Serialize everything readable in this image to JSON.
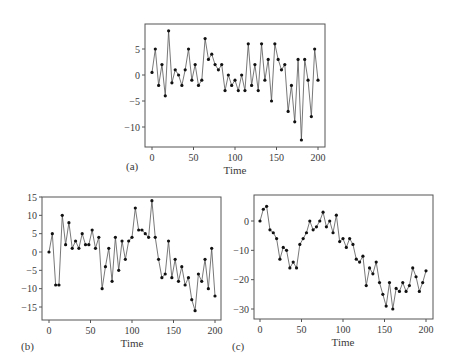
{
  "figure": {
    "panels": [
      "(a)",
      "(b)",
      "(c)"
    ]
  },
  "colors": {
    "line": "#555555",
    "marker": "#111111",
    "frame": "#555555",
    "text": "#3a3a3a"
  },
  "chart_data": [
    {
      "type": "line",
      "panel_label": "(a)",
      "title": "",
      "xlabel": "Time",
      "ylabel": "",
      "xlim": [
        0,
        200
      ],
      "ylim": [
        -13.5,
        9.5
      ],
      "xticks": [
        0,
        50,
        100,
        150,
        200
      ],
      "yticks": [
        5,
        0,
        -5,
        -10
      ],
      "grid": false,
      "markers": true,
      "x": [
        0,
        4,
        8,
        12,
        16,
        20,
        24,
        28,
        32,
        36,
        40,
        44,
        48,
        52,
        56,
        60,
        64,
        68,
        72,
        76,
        80,
        84,
        88,
        92,
        96,
        100,
        104,
        108,
        112,
        116,
        120,
        124,
        128,
        132,
        136,
        140,
        144,
        148,
        152,
        156,
        160,
        164,
        168,
        172,
        176,
        180,
        184,
        188,
        192,
        196,
        200
      ],
      "series": [
        {
          "name": "a",
          "values": [
            0.5,
            5,
            -2,
            2,
            -4,
            8.5,
            -1.5,
            1,
            0,
            -2,
            1,
            5,
            -1,
            2,
            -2,
            -1,
            7,
            3,
            4,
            2,
            1,
            2,
            -3,
            0,
            -2,
            -1,
            -3,
            0,
            -3,
            6,
            -2,
            2,
            -3,
            6,
            -1,
            3,
            -5,
            6,
            3,
            1,
            2,
            -7,
            -2,
            -9,
            3,
            -12.5,
            3,
            -1,
            -8,
            5,
            -1
          ]
        }
      ]
    },
    {
      "type": "line",
      "panel_label": "(b)",
      "title": "",
      "xlabel": "Time",
      "ylabel": "",
      "xlim": [
        0,
        200
      ],
      "ylim": [
        -18,
        15
      ],
      "xticks": [
        0,
        50,
        100,
        150,
        200
      ],
      "yticks": [
        15,
        10,
        5,
        0,
        -5,
        -10,
        -15
      ],
      "grid": false,
      "markers": true,
      "x": [
        0,
        4,
        8,
        12,
        16,
        20,
        24,
        28,
        32,
        36,
        40,
        44,
        48,
        52,
        56,
        60,
        64,
        68,
        72,
        76,
        80,
        84,
        88,
        92,
        96,
        100,
        104,
        108,
        112,
        116,
        120,
        124,
        128,
        132,
        136,
        140,
        144,
        148,
        152,
        156,
        160,
        164,
        168,
        172,
        176,
        180,
        184,
        188,
        192,
        196,
        200
      ],
      "series": [
        {
          "name": "b",
          "values": [
            0,
            5,
            -9,
            -9,
            10,
            2,
            8,
            1,
            3,
            1,
            5,
            2,
            2,
            6,
            1,
            4,
            -10,
            -4,
            1,
            -8,
            4,
            -5,
            3,
            -2,
            3,
            4,
            12,
            6,
            6,
            5,
            4,
            14,
            4,
            -2,
            -7,
            -6,
            3,
            -7,
            -2,
            -8,
            -4,
            -9,
            -7,
            -13,
            -16,
            -6,
            -8,
            -2,
            -10,
            1,
            -12
          ]
        }
      ]
    },
    {
      "type": "line",
      "panel_label": "(c)",
      "title": "",
      "xlabel": "Time",
      "ylabel": "",
      "xlim": [
        0,
        200
      ],
      "ylim": [
        -33,
        8
      ],
      "xticks": [
        0,
        50,
        100,
        150,
        200
      ],
      "yticks": [
        0,
        -10,
        -20,
        -30
      ],
      "grid": false,
      "markers": true,
      "x": [
        0,
        4,
        8,
        12,
        16,
        20,
        24,
        28,
        32,
        36,
        40,
        44,
        48,
        52,
        56,
        60,
        64,
        68,
        72,
        76,
        80,
        84,
        88,
        92,
        96,
        100,
        104,
        108,
        112,
        116,
        120,
        124,
        128,
        132,
        136,
        140,
        144,
        148,
        152,
        156,
        160,
        164,
        168,
        172,
        176,
        180,
        184,
        188,
        192,
        196,
        200
      ],
      "series": [
        {
          "name": "c",
          "values": [
            0,
            4,
            5,
            -3,
            -4,
            -6,
            -13,
            -9,
            -10,
            -16,
            -14,
            -16,
            -8,
            -6,
            -4,
            0,
            -3,
            -2,
            0,
            3,
            -2,
            0,
            -4,
            2,
            -7,
            -6,
            -9,
            -6,
            -8,
            -13,
            -14,
            -12,
            -22,
            -16,
            -18,
            -14,
            -21,
            -25,
            -29,
            -21,
            -30,
            -23,
            -24,
            -21,
            -24,
            -22,
            -16,
            -19,
            -24,
            -21,
            -17
          ]
        }
      ]
    }
  ]
}
